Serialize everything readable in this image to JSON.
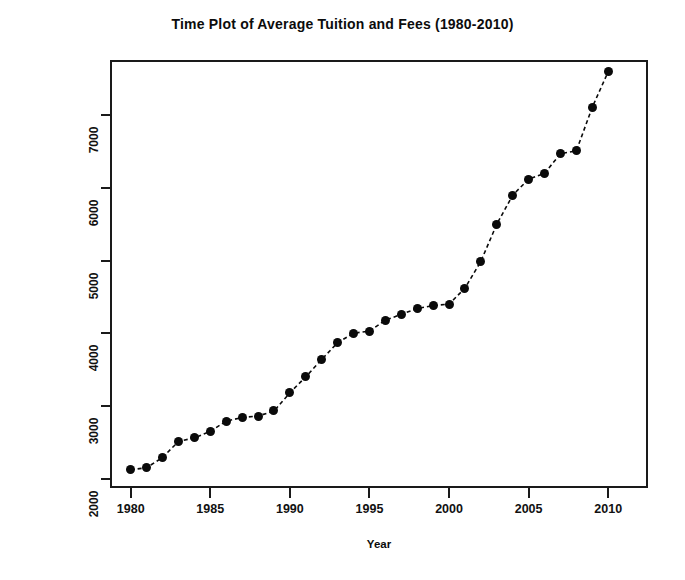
{
  "figure": {
    "title": "Time Plot of Average Tuition and Fees (1980-2010)",
    "background": "#ffffff",
    "foreground": "#0a0a0a"
  },
  "axes": {
    "x": {
      "label": "Year",
      "ticks": [
        1980,
        1985,
        1990,
        1995,
        2000,
        2005,
        2010
      ],
      "tick_labels": [
        "1980",
        "1985",
        "1990",
        "1995",
        "2000",
        "2005",
        "2010"
      ],
      "range": [
        1978.7,
        2012.5
      ]
    },
    "y": {
      "label": "Average Tuition ($)",
      "ticks": [
        2000,
        3000,
        4000,
        5000,
        6000,
        7000
      ],
      "tick_labels": [
        "2000",
        "3000",
        "4000",
        "5000",
        "6000",
        "7000"
      ],
      "range": [
        1870,
        7760
      ]
    }
  },
  "chart_data": {
    "type": "line",
    "title": "Time Plot of Average Tuition and Fees (1980-2010)",
    "xlabel": "Year",
    "ylabel": "Average Tuition ($)",
    "xlim": [
      1978.7,
      2012.5
    ],
    "ylim": [
      1870,
      7760
    ],
    "grid": false,
    "legend": null,
    "marker": "filled-circle",
    "linestyle": "dashed",
    "color": "#0a0a0a",
    "x": [
      1980,
      1981,
      1982,
      1983,
      1984,
      1985,
      1986,
      1987,
      1988,
      1989,
      1990,
      1991,
      1992,
      1993,
      1994,
      1995,
      1996,
      1997,
      1998,
      1999,
      2000,
      2001,
      2002,
      2003,
      2004,
      2005,
      2006,
      2007,
      2008,
      2009,
      2010
    ],
    "values": [
      2120,
      2150,
      2290,
      2510,
      2560,
      2650,
      2790,
      2840,
      2860,
      2930,
      3180,
      3400,
      3640,
      3870,
      4000,
      4030,
      4180,
      4260,
      4340,
      4380,
      4400,
      4620,
      4990,
      5500,
      5900,
      6120,
      6200,
      6470,
      6510,
      7110,
      7600
    ],
    "series": [
      {
        "name": "Average Tuition and Fees",
        "values": [
          2120,
          2150,
          2290,
          2510,
          2560,
          2650,
          2790,
          2840,
          2860,
          2930,
          3180,
          3400,
          3640,
          3870,
          4000,
          4030,
          4180,
          4260,
          4340,
          4380,
          4400,
          4620,
          4990,
          5500,
          5900,
          6120,
          6200,
          6470,
          6510,
          7110,
          7600
        ]
      }
    ]
  }
}
